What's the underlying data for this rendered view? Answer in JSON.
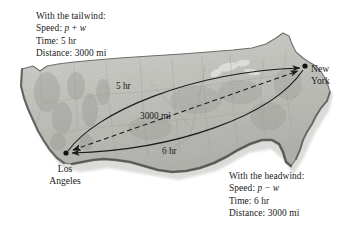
{
  "figure": {
    "background_color": "#ffffff",
    "map_fill": "#c9c9c4",
    "map_stroke": "#6d6d6b",
    "ink_color": "#1a1a1a"
  },
  "tailwind": {
    "heading": "With the tailwind:",
    "speed_label": "Speed: ",
    "speed_var_1": "p",
    "speed_operator": " + ",
    "speed_var_2": "w",
    "time": "Time: 5 hr",
    "distance": "Distance: 3000 mi"
  },
  "headwind": {
    "heading": "With the headwind:",
    "speed_label": "Speed: ",
    "speed_var_1": "p",
    "speed_operator": " − ",
    "speed_var_2": "w",
    "time": "Time: 6 hr",
    "distance": "Distance: 3000 mi"
  },
  "cities": [
    {
      "name": "los-angeles",
      "line1": "Los",
      "line2": "Angeles",
      "x": 66,
      "y": 153
    },
    {
      "name": "new-york",
      "line1": "New",
      "line2": "York",
      "x": 305,
      "y": 66
    }
  ],
  "annotations": {
    "outbound_time": "5 hr",
    "straight_distance": "3000 mi",
    "return_time": "6 hr"
  },
  "routes": [
    {
      "name": "outbound-tailwind-arc",
      "label": "5 hr",
      "from": "los-angeles",
      "to": "new-york",
      "style": "solid-curve",
      "arrow_at": "new-york"
    },
    {
      "name": "great-circle-distance",
      "label": "3000 mi",
      "from": "los-angeles",
      "to": "new-york",
      "style": "dashed-straight",
      "arrow_at": "both"
    },
    {
      "name": "return-headwind-arc",
      "label": "6 hr",
      "from": "new-york",
      "to": "los-angeles",
      "style": "solid-curve",
      "arrow_at": "los-angeles"
    }
  ]
}
